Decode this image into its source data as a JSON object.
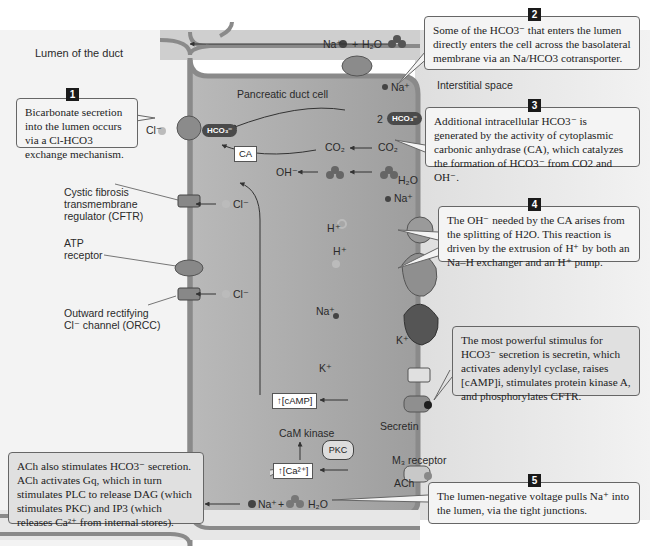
{
  "diagram": {
    "regions": {
      "lumen": "Lumen of the duct",
      "cell": "Pancreatic duct cell",
      "interstitial": "Interstitial space"
    },
    "callouts": [
      {
        "number": "1",
        "text": "Bicarbonate secretion into the lumen occurs via a Cl-HCO3 exchange mechanism."
      },
      {
        "number": "2",
        "text": "Some of the HCO3⁻ that enters the lumen directly enters the cell across the basolateral membrane via an Na/HCO3 cotransporter."
      },
      {
        "number": "3",
        "text": "Additional intracellular HCO3⁻ is generated by the activity of cytoplasmic carbonic anhydrase (CA), which catalyzes the formation of HCO3⁻ from CO2 and OH⁻."
      },
      {
        "number": "4",
        "text": "The OH⁻ needed by the CA arises from the splitting of H2O. This reaction is driven by the extrusion of H⁺ by both an Na–H exchanger and an H⁺ pump."
      },
      {
        "number": "",
        "text": "The most powerful stimulus for HCO3⁻ secretion is secretin, which activates adenylyl cyclase, raises [cAMP]i, stimulates protein kinase A, and phosphorylates CFTR."
      },
      {
        "number": "",
        "text": "ACh also stimulates HCO3⁻ secretion. ACh activates Gq, which in turn stimulates PLC to release DAG (which stimulates PKC) and IP3 (which releases Ca²⁺ from internal stores)."
      },
      {
        "number": "5",
        "text": "The lumen-negative voltage pulls Na⁺ into the lumen, via the tight junctions."
      }
    ],
    "membrane_labels": {
      "cftr": "Cystic fibrosis\ntransmembrane\nregulator (CFTR)",
      "atp_receptor": "ATP\nreceptor",
      "orcc": "Outward rectifying\nCl⁻ channel (ORCC)",
      "m3_receptor": "M₃ receptor",
      "ach": "ACh",
      "secretin": "Secretin"
    },
    "molecules": {
      "cl1": "Cl⁻",
      "cl2": "Cl⁻",
      "cl3": "Cl⁻",
      "hco3_in": "HCO₃⁻",
      "hco3_baso": "HCO₃⁻",
      "two": "2",
      "na_top": "Na⁺",
      "plus_top": "+",
      "h2o_top": "H₂O",
      "na_baso": "Na⁺",
      "co2_in": "CO₂",
      "co2_out": "CO₂",
      "ca": "CA",
      "oh": "OH⁻",
      "h2o_out": "H₂O",
      "na_nhe": "Na⁺",
      "h_nhe": "H⁺",
      "h_pump": "H⁺",
      "na_pump": "Na⁺",
      "k_pump": "K⁺",
      "k_channel": "K⁺",
      "camp": "↑[cAMP]",
      "cam_kinase": "CaM kinase",
      "pkc": "PKC",
      "ca2": "↑[Ca²⁺]",
      "na_bottom": "Na⁺",
      "plus_bottom": "+",
      "h2o_bottom": "H₂O"
    },
    "colors": {
      "cell_fill": "#a9a9a9",
      "membrane": "#8a8a8a",
      "interstitial": "#e6e6e6",
      "callout_fill": "#f4f4f4",
      "callout_border": "#666666"
    }
  }
}
